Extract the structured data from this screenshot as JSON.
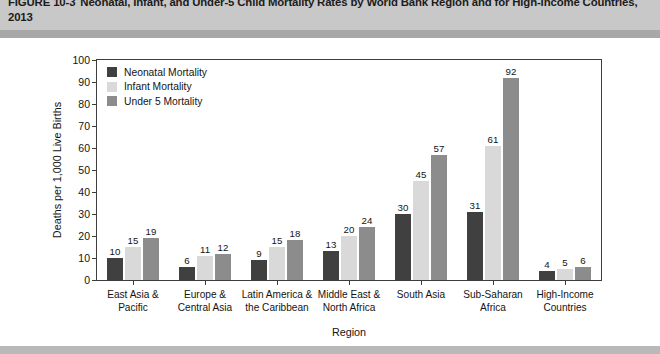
{
  "figure": {
    "number": "FIGURE 10-3",
    "caption": "Neonatal, Infant, and Under-5 Child Mortality Rates by World Bank Region and for High-Income Countries, 2013"
  },
  "colors": {
    "neonatal": "#404040",
    "infant": "#d9d9d9",
    "under5": "#8c8c8c",
    "axis": "#3d3d3d",
    "header_band": "#c8c8c8",
    "header_rule": "#a8a8a8",
    "footer_band": "#b9b9b9",
    "text": "#141414"
  },
  "chart_data": {
    "type": "bar",
    "title": "Neonatal, Infant, and Under-5 Child Mortality Rates by World Bank Region and for High-Income Countries, 2013",
    "xlabel": "Region",
    "ylabel": "Deaths per 1,000 Live Births",
    "ylim": [
      0,
      100
    ],
    "yticks": [
      0,
      10,
      20,
      30,
      40,
      50,
      60,
      70,
      80,
      90,
      100
    ],
    "grid": false,
    "legend_position": "top-left inside plot",
    "categories": [
      "East Asia & Pacific",
      "Europe & Central Asia",
      "Latin America & the Caribbean",
      "Middle East & North Africa",
      "South Asia",
      "Sub-Saharan Africa",
      "High-Income Countries"
    ],
    "category_lines": [
      [
        "East Asia &",
        "Pacific"
      ],
      [
        "Europe &",
        "Central Asia"
      ],
      [
        "Latin America &",
        "the Caribbean"
      ],
      [
        "Middle East &",
        "North Africa"
      ],
      [
        "South Asia",
        ""
      ],
      [
        "Sub-Saharan",
        "Africa"
      ],
      [
        "High-Income",
        "Countries"
      ]
    ],
    "series": [
      {
        "name": "Neonatal Mortality",
        "color": "#404040",
        "values": [
          10,
          6,
          9,
          13,
          30,
          31,
          4
        ]
      },
      {
        "name": "Infant Mortality",
        "color": "#d9d9d9",
        "values": [
          15,
          11,
          15,
          20,
          45,
          61,
          5
        ]
      },
      {
        "name": "Under 5 Mortality",
        "color": "#8c8c8c",
        "values": [
          19,
          12,
          18,
          24,
          57,
          92,
          6
        ]
      }
    ]
  }
}
